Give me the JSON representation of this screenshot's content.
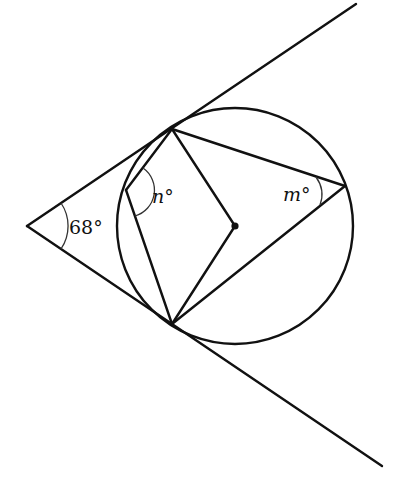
{
  "diagram": {
    "type": "geometry",
    "colors": {
      "stroke": "#111111",
      "background": "#ffffff",
      "arc": "#333333"
    },
    "points": {
      "external_vertex": {
        "x": 27,
        "y": 226
      },
      "tangent_top": {
        "x": 172,
        "y": 129
      },
      "tangent_bottom": {
        "x": 172,
        "y": 324
      },
      "circle_left": {
        "x": 126,
        "y": 190
      },
      "circle_right": {
        "x": 345,
        "y": 186
      },
      "center": {
        "x": 235,
        "y": 226
      }
    },
    "circle": {
      "cx": 235,
      "cy": 226,
      "r": 118
    },
    "tangent_line_top_end": {
      "x": 356,
      "y": 4
    },
    "tangent_line_bottom_end": {
      "x": 382,
      "y": 466
    },
    "labels": {
      "external_angle": {
        "value": "68",
        "unit": "°"
      },
      "angle_n": {
        "var": "n",
        "unit": "°"
      },
      "angle_m": {
        "var": "m",
        "unit": "°"
      }
    }
  }
}
